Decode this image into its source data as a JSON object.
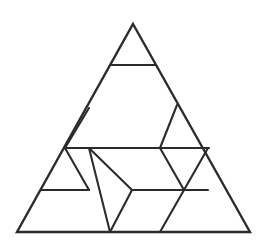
{
  "figure": {
    "background_color": "#ffffff",
    "line_color": "#2b2b2b",
    "line_width": 2.1,
    "canvas": {
      "width": 270,
      "height": 243
    },
    "outline": {
      "name": "outer-triangle",
      "points": "133,24 250,232 17,232",
      "apex": {
        "x": 133,
        "y": 24
      },
      "bottom_left": {
        "x": 17,
        "y": 232
      },
      "bottom_right": {
        "x": 250,
        "y": 232
      }
    },
    "segments": [
      {
        "name": "top-horizontal",
        "x1": 110,
        "y1": 65,
        "x2": 156,
        "y2": 65,
        "kind": "horizontal"
      },
      {
        "name": "mid-horizontal",
        "x1": 65,
        "y1": 148,
        "x2": 209,
        "y2": 148,
        "kind": "horizontal"
      },
      {
        "name": "lower-left-horizontal",
        "x1": 41,
        "y1": 190,
        "x2": 89,
        "y2": 190,
        "kind": "horizontal"
      },
      {
        "name": "lower-right-horizontal",
        "x1": 132,
        "y1": 190,
        "x2": 208,
        "y2": 190,
        "kind": "horizontal"
      },
      {
        "name": "left-upper-diagonal",
        "x1": 89,
        "y1": 108,
        "x2": 65,
        "y2": 148,
        "kind": "diagonal"
      },
      {
        "name": "left-rhombus-left-edge",
        "x1": 89,
        "y1": 148,
        "x2": 110,
        "y2": 232,
        "kind": "diagonal"
      },
      {
        "name": "left-rhombus-right-edge",
        "x1": 132,
        "y1": 190,
        "x2": 110,
        "y2": 232,
        "kind": "diagonal"
      },
      {
        "name": "left-rhombus-upper-right-edge",
        "x1": 89,
        "y1": 148,
        "x2": 132,
        "y2": 190,
        "kind": "diagonal"
      },
      {
        "name": "left-lower-diagonal",
        "x1": 65,
        "y1": 148,
        "x2": 89,
        "y2": 190,
        "kind": "diagonal"
      },
      {
        "name": "right-upper-left-diagonal",
        "x1": 177,
        "y1": 105,
        "x2": 160,
        "y2": 148,
        "kind": "diagonal"
      },
      {
        "name": "right-down-triangle-left-edge",
        "x1": 160,
        "y1": 148,
        "x2": 184,
        "y2": 190,
        "kind": "diagonal"
      },
      {
        "name": "right-down-triangle-right-edge",
        "x1": 208,
        "y1": 148,
        "x2": 184,
        "y2": 190,
        "kind": "diagonal"
      },
      {
        "name": "right-lower-diagonal",
        "x1": 184,
        "y1": 190,
        "x2": 160,
        "y2": 232,
        "kind": "diagonal"
      }
    ],
    "vertices": [
      {
        "name": "apex",
        "x": 133,
        "y": 24
      },
      {
        "name": "top-left-node",
        "x": 110,
        "y": 65
      },
      {
        "name": "top-right-node",
        "x": 156,
        "y": 65
      },
      {
        "name": "right-edge-node-upper",
        "x": 177,
        "y": 105
      },
      {
        "name": "left-edge-node-upper",
        "x": 89,
        "y": 108
      },
      {
        "name": "left-edge-node-mid",
        "x": 65,
        "y": 148
      },
      {
        "name": "mid-left-node",
        "x": 89,
        "y": 148
      },
      {
        "name": "mid-center-node",
        "x": 160,
        "y": 148
      },
      {
        "name": "right-edge-node-mid",
        "x": 209,
        "y": 148
      },
      {
        "name": "left-edge-node-lower",
        "x": 41,
        "y": 190
      },
      {
        "name": "lower-left-node",
        "x": 89,
        "y": 190
      },
      {
        "name": "lower-center-node",
        "x": 132,
        "y": 190
      },
      {
        "name": "lower-right-node",
        "x": 184,
        "y": 190
      },
      {
        "name": "right-edge-node-lower",
        "x": 208,
        "y": 190
      },
      {
        "name": "bottom-left-corner",
        "x": 17,
        "y": 232
      },
      {
        "name": "bottom-node-left",
        "x": 110,
        "y": 232
      },
      {
        "name": "bottom-node-right",
        "x": 160,
        "y": 232
      },
      {
        "name": "bottom-right-corner",
        "x": 250,
        "y": 232
      }
    ]
  }
}
